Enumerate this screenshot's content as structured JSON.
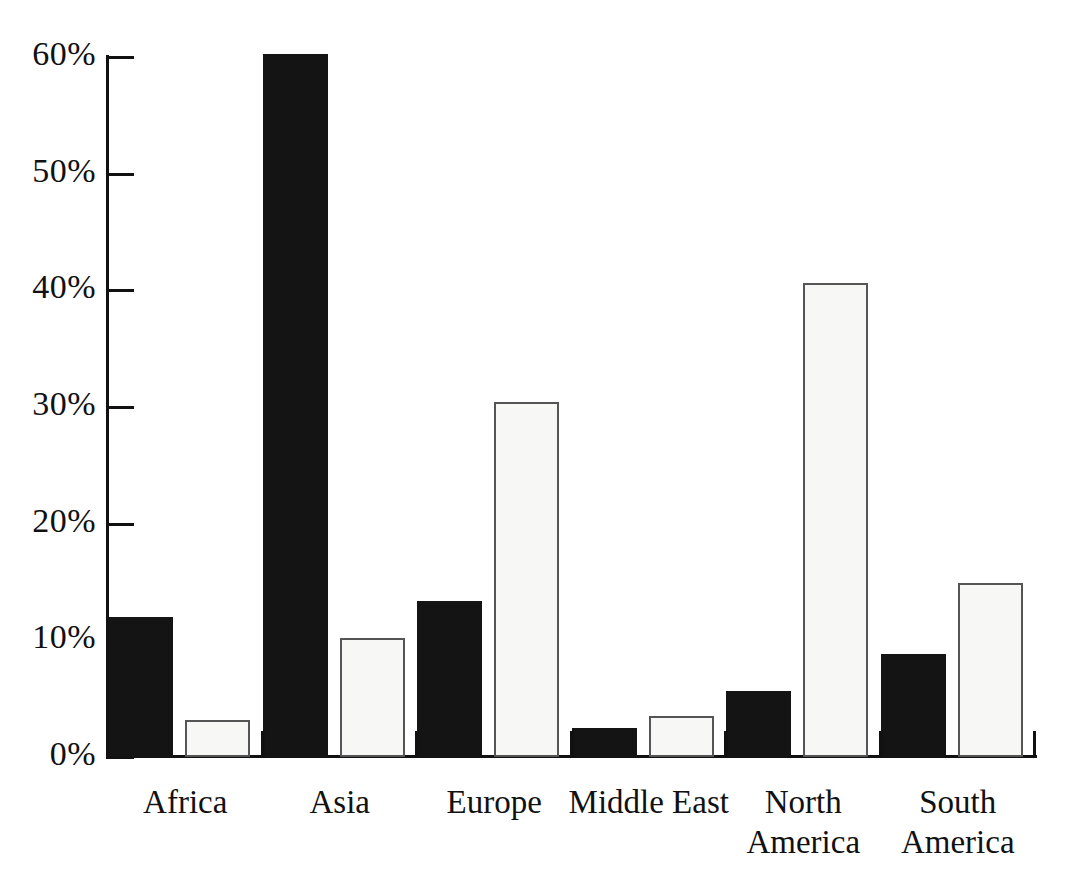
{
  "chart_data": {
    "type": "bar",
    "title": "",
    "subtitle": "",
    "xlabel": "",
    "ylabel": "",
    "ylim": [
      0,
      60
    ],
    "y_tick_labels": [
      "60%",
      "50%",
      "40%",
      "30%",
      "20%",
      "10%",
      "0%"
    ],
    "y_ticks": [
      60,
      50,
      40,
      30,
      20,
      10,
      0
    ],
    "grid": false,
    "legend_position": "none",
    "value_format": "percent",
    "categories": [
      "Africa",
      "Asia",
      "Europe",
      "Middle East",
      "North\nAmerica",
      "South\nAmerica"
    ],
    "series": [
      {
        "name": "Series 1",
        "color": "#141414",
        "style": "filled-black",
        "values": [
          12.0,
          60.3,
          13.4,
          2.5,
          5.7,
          8.8
        ]
      },
      {
        "name": "Series 2",
        "color": "#f7f7f5",
        "style": "outlined-white",
        "values": [
          3.2,
          10.2,
          30.4,
          3.5,
          40.6,
          14.9
        ]
      }
    ]
  },
  "axis": {
    "y_labels": [
      {
        "text": "60%",
        "value": 60
      },
      {
        "text": "50%",
        "value": 50
      },
      {
        "text": "40%",
        "value": 40
      },
      {
        "text": "30%",
        "value": 30
      },
      {
        "text": "20%",
        "value": 20
      },
      {
        "text": "10%",
        "value": 10
      },
      {
        "text": "0%",
        "value": 0
      }
    ]
  },
  "colors": {
    "series_dark": "#141414",
    "series_light": "#f7f7f5",
    "light_bar_outline": "#555555",
    "axis": "#111111",
    "background": "#ffffff",
    "text": "#111111"
  }
}
